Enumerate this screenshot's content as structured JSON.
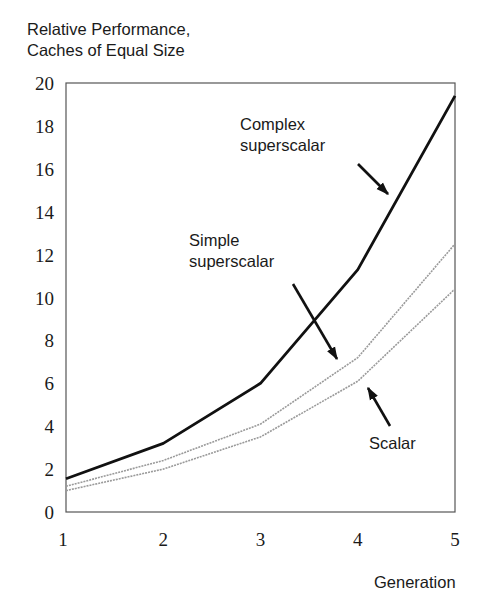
{
  "chart_data": {
    "type": "line",
    "title": "Relative Performance, Caches of Equal Size",
    "title_lines": [
      "Relative Performance,",
      "Caches of Equal Size"
    ],
    "xlabel": "Generation",
    "ylabel": "",
    "x": [
      1,
      2,
      3,
      4,
      5
    ],
    "xticks": [
      "1",
      "2",
      "3",
      "4",
      "5"
    ],
    "yticks": [
      "0",
      "2",
      "4",
      "6",
      "8",
      "10",
      "12",
      "14",
      "16",
      "18",
      "20"
    ],
    "xlim": [
      1,
      5
    ],
    "ylim": [
      0,
      20
    ],
    "grid": false,
    "legend": "none (inline annotations with arrows)",
    "series": [
      {
        "name": "Complex superscalar",
        "values": [
          1.55,
          3.2,
          6.0,
          11.3,
          19.4
        ],
        "color": "#111111",
        "style": "solid-thick"
      },
      {
        "name": "Simple superscalar",
        "values": [
          1.2,
          2.4,
          4.1,
          7.2,
          12.5
        ],
        "color": "#9a9a9a",
        "style": "thin-gray"
      },
      {
        "name": "Scalar",
        "values": [
          1.0,
          2.0,
          3.5,
          6.1,
          10.4
        ],
        "color": "#9a9a9a",
        "style": "thin-gray"
      }
    ],
    "annotations": [
      {
        "lines": [
          "Complex",
          "superscalar"
        ],
        "target_series": "Complex superscalar"
      },
      {
        "lines": [
          "Simple",
          "superscalar"
        ],
        "target_series": "Simple superscalar"
      },
      {
        "lines": [
          "Scalar"
        ],
        "target_series": "Scalar"
      }
    ]
  }
}
